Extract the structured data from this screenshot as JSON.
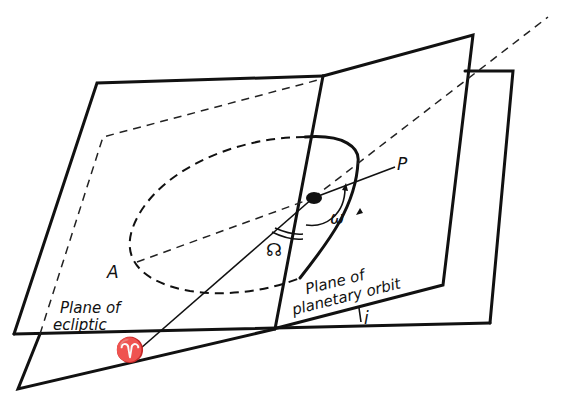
{
  "figure": {
    "type": "orbital-elements-diagram",
    "labels": {
      "ecliptic_plane": [
        "Plane of",
        "ecliptic"
      ],
      "orbit_plane": [
        "Plane of",
        "planetary orbit"
      ],
      "perihelion": "P",
      "aphelion": "A",
      "vernal_equinox": "♈",
      "ascending_node_angle": "☊",
      "argument_of_perihelion": "ω",
      "inclination": "i"
    },
    "colors": {
      "ink": "#111111",
      "background": "#ffffff"
    }
  }
}
